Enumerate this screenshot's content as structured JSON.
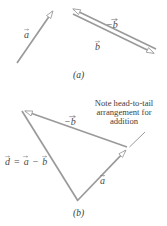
{
  "figure": {
    "line_color": "#9a9a9a",
    "text_color": "#4a4a4a",
    "background": "#ffffff",
    "panel_a": {
      "caption": "(a)",
      "labels": {
        "vec_a": "a",
        "vec_minus_b": "−b",
        "vec_b": "b"
      },
      "vectors": [
        {
          "name": "a",
          "from": [
            17,
            63
          ],
          "to": [
            55,
            8
          ],
          "arrow_at": "head"
        },
        {
          "name": "-b",
          "from": [
            156,
            49
          ],
          "to": [
            70,
            7
          ],
          "arrow_at": "head"
        },
        {
          "name": "b",
          "from": [
            73,
            14
          ],
          "to": [
            157,
            55
          ],
          "arrow_at": "head"
        }
      ]
    },
    "panel_b": {
      "caption": "(b)",
      "labels": {
        "vec_minus_b": "−b",
        "vec_a": "a",
        "equation_d": "d",
        "equation_eq": "=",
        "equation_a": "a",
        "equation_minus": "−",
        "equation_b": "b"
      },
      "note": {
        "line1": "Note head-to-tail",
        "line2": "arrangement for",
        "line3": "addition"
      },
      "vectors": [
        {
          "name": "-b",
          "from": [
            127,
            147
          ],
          "to": [
            22,
            110
          ],
          "arrow_at": "head"
        },
        {
          "name": "a",
          "from": [
            78,
            200
          ],
          "to": [
            128,
            148
          ],
          "arrow_at": "head"
        },
        {
          "name": "d",
          "from": [
            22,
            111
          ],
          "to": [
            78,
            201
          ],
          "arrow_at": "none"
        }
      ],
      "leader_line": {
        "from": [
          144,
          133
        ],
        "to": [
          128,
          148
        ]
      }
    }
  }
}
